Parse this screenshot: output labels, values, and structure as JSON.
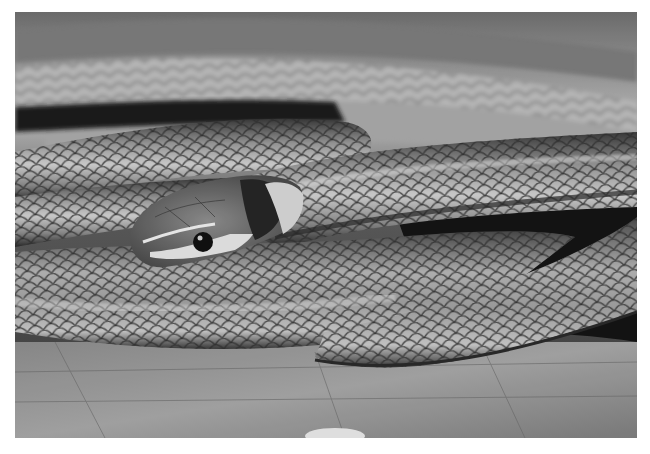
{
  "image": {
    "alt": "Black and white photograph of a coiled striped snake resting on a wooden surface, head with light lip band and dark nape patch",
    "subject": "coiled snake",
    "palette": {
      "background": "#ffffff",
      "dark": "#1e1e1e",
      "mid": "#7a7a7a",
      "light": "#d8d8d8",
      "highlight": "#f0f0f0"
    }
  }
}
